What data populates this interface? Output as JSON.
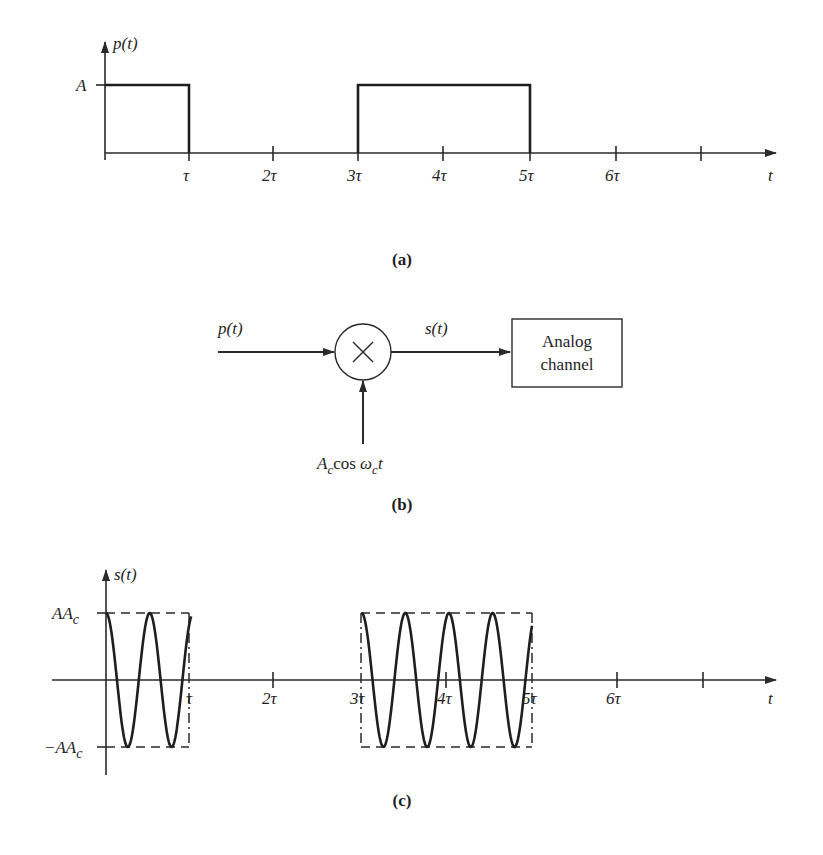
{
  "colors": {
    "ink": "#1e1e1e",
    "background": "#ffffff"
  },
  "panel_a": {
    "caption": "(a)",
    "y_label": "p(t)",
    "x_label": "t",
    "level_label": "A",
    "tick_labels": [
      "τ",
      "2τ",
      "3τ",
      "4τ",
      "5τ",
      "6τ",
      ""
    ],
    "pulses": [
      {
        "start": 0,
        "end": 1,
        "amplitude": "A"
      },
      {
        "start": 3,
        "end": 5,
        "amplitude": "A"
      }
    ]
  },
  "panel_b": {
    "caption": "(b)",
    "input_label": "p(t)",
    "output_label": "s(t)",
    "multiplier_symbol": "×",
    "carrier_label_A": "A",
    "carrier_label_sub1": "c",
    "carrier_label_cos": "cos ",
    "carrier_label_omega": "ω",
    "carrier_label_sub2": "c",
    "carrier_label_t": "t",
    "block_line1": "Analog",
    "block_line2": "channel"
  },
  "panel_c": {
    "caption": "(c)",
    "y_label": "s(t)",
    "x_label": "t",
    "upper_label_main": "AA",
    "upper_label_sub": "c",
    "lower_label_main": "−AA",
    "lower_label_sub": "c",
    "tick_labels": [
      "τ",
      "2τ",
      "3τ",
      "4τ",
      "5τ",
      "6τ",
      ""
    ],
    "bursts": [
      {
        "start": 0,
        "end": 1
      },
      {
        "start": 3,
        "end": 5
      }
    ],
    "carrier_cycles_per_tau": 1.95
  }
}
